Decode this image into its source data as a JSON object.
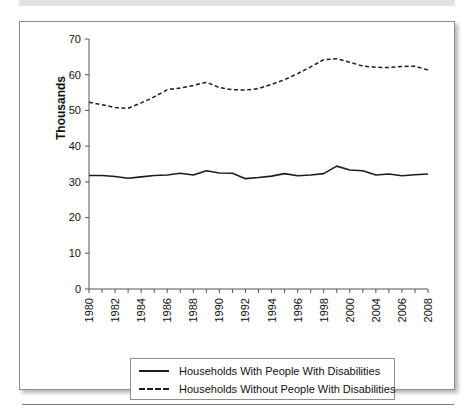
{
  "figure": {
    "frame_border_color": "#8d8d8d",
    "background_color": "#ffffff",
    "line_color": "#1d1d1d"
  },
  "chart_data": {
    "type": "line",
    "title": "",
    "xlabel": "",
    "ylabel": "Thousands",
    "ylim": [
      0,
      70
    ],
    "yticks": [
      0,
      10,
      20,
      30,
      40,
      50,
      60,
      70
    ],
    "grid": false,
    "legend_position": "bottom",
    "x_tick_labels": [
      "1980",
      "1982",
      "1984",
      "1986",
      "1988",
      "1990",
      "1992",
      "1994",
      "1996",
      "1998",
      "2000",
      "2004",
      "2006",
      "2008"
    ],
    "x": [
      1980,
      1981,
      1982,
      1983,
      1984,
      1985,
      1986,
      1987,
      1988,
      1989,
      1990,
      1991,
      1992,
      1993,
      1994,
      1995,
      1996,
      1997,
      1998,
      1999,
      2000,
      2001,
      2004,
      2005,
      2006,
      2007,
      2008
    ],
    "series": [
      {
        "name": "Households With People With Disabilities",
        "style": "solid",
        "values": [
          31.8,
          31.8,
          31.5,
          31.0,
          31.4,
          31.8,
          31.9,
          32.4,
          31.9,
          33.1,
          32.5,
          32.4,
          30.9,
          31.2,
          31.6,
          32.3,
          31.7,
          31.9,
          32.3,
          34.4,
          33.3,
          33.1,
          31.9,
          32.2,
          31.7,
          32.0,
          32.2
        ]
      },
      {
        "name": "Households Without People With Disabilities",
        "style": "dashed",
        "values": [
          52.3,
          51.6,
          50.8,
          50.6,
          52.1,
          53.8,
          55.8,
          56.3,
          57.0,
          57.9,
          56.4,
          55.8,
          55.7,
          56.1,
          57.3,
          58.6,
          60.3,
          62.2,
          64.2,
          64.5,
          63.5,
          62.4,
          62.1,
          62.0,
          62.3,
          62.4,
          61.3
        ]
      }
    ]
  },
  "legend": {
    "items": [
      {
        "label": "Households With People With Disabilities",
        "style": "solid"
      },
      {
        "label": "Households Without People With Disabilities",
        "style": "dashed"
      }
    ]
  }
}
